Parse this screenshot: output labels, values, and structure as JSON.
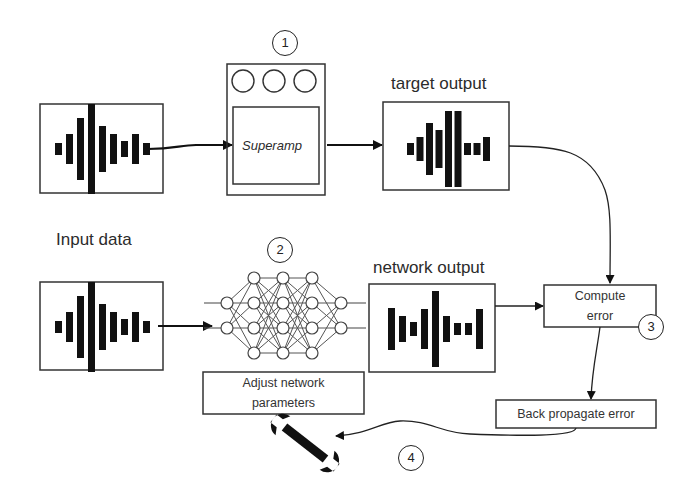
{
  "diagram": {
    "labels": {
      "target_output": "target output",
      "input_data": "Input data",
      "network_output": "network output"
    },
    "nodes": {
      "amp": {
        "label": "Superamp",
        "step": "1"
      },
      "network": {
        "step": "2"
      },
      "compute_error": {
        "line1": "Compute",
        "line2": "error",
        "step": "3"
      },
      "back_propagate": {
        "label": "Back propagate error"
      },
      "adjust": {
        "line1": "Adjust network",
        "line2": "parameters"
      },
      "wrench": {
        "step": "4"
      }
    },
    "waveforms": {
      "input_top": [
        12,
        30,
        62,
        90,
        46,
        30,
        16,
        30,
        12
      ],
      "input_bottom": [
        12,
        30,
        62,
        90,
        46,
        30,
        16,
        30,
        12
      ],
      "target": [
        12,
        24,
        52,
        38,
        76,
        76,
        12,
        12,
        24
      ],
      "network": [
        42,
        26,
        14,
        40,
        76,
        26,
        12,
        12,
        40
      ]
    },
    "edges": [
      {
        "from": "input_top",
        "to": "amp"
      },
      {
        "from": "amp",
        "to": "target"
      },
      {
        "from": "target",
        "to": "compute_error"
      },
      {
        "from": "input_bottom",
        "to": "network"
      },
      {
        "from": "network",
        "to": "network_output"
      },
      {
        "from": "network_output",
        "to": "compute_error"
      },
      {
        "from": "compute_error",
        "to": "back_propagate"
      },
      {
        "from": "back_propagate",
        "to": "wrench"
      }
    ],
    "colors": {
      "stroke": "#333333",
      "fill": "#111111",
      "background": "#ffffff"
    }
  }
}
